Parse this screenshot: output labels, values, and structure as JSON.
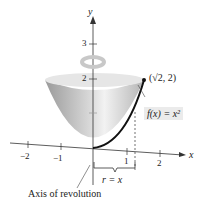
{
  "diagram": {
    "axis_labels": {
      "x": "x",
      "y": "y"
    },
    "x_ticks": [
      "−2",
      "−1",
      "1",
      "2"
    ],
    "y_ticks": [
      "2",
      "3"
    ],
    "point_label": "(√2, 2)",
    "function_label": "f(x) = x²",
    "radius_label": "r = x",
    "axis_of_revolution_label": "Axis of revolution",
    "colors": {
      "surface": "#c8c8c8",
      "curve": "#111111",
      "label_bg": "#ebebeb"
    }
  }
}
